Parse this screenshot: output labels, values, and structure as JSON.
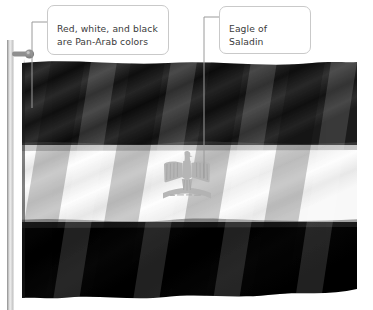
{
  "image": {
    "subject": "Flag of Egypt",
    "rendering": "grayscale photograph of waving flag on pole",
    "width": 373,
    "height": 310
  },
  "annotations": [
    {
      "id": "pan-arab",
      "text": "Red, white, and black\nare Pan-Arab colors",
      "target": "flag stripes"
    },
    {
      "id": "eagle",
      "text": "Eagle of Saladin",
      "target": "flag emblem"
    }
  ],
  "flag": {
    "stripes": [
      {
        "name": "top-stripe",
        "true_color": "Red",
        "rendered": "#1a1a1a"
      },
      {
        "name": "middle-stripe",
        "true_color": "White",
        "rendered": "#fbfbfb"
      },
      {
        "name": "bottom-stripe",
        "true_color": "Black",
        "rendered": "#000000"
      }
    ],
    "emblem": {
      "name": "Eagle of Saladin",
      "rendered": "#b9b9b9"
    },
    "pole": {
      "name": "flagpole",
      "rendered": "#d8d8d8"
    }
  },
  "colors": {
    "callout_border": "#c9c9c9",
    "callout_text": "#3b3b3b",
    "leader_line": "#9a9a9a",
    "background": "#ffffff"
  }
}
